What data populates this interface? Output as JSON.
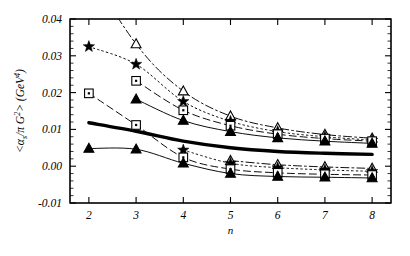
{
  "chart_data": {
    "type": "line",
    "title": "",
    "xlabel": "n",
    "ylabel": "<(αs/π) G2> (GeV4)",
    "ylabel_parts": {
      "bracket_open": "<",
      "numerator": "α",
      "numerator_sub": "s",
      "denominator": "π",
      "g": "G",
      "g_sup": "2",
      "bracket_close": ">",
      "units_open": "(",
      "units": "GeV",
      "units_sup": "4",
      "units_close": ")"
    },
    "x": [
      2,
      3,
      4,
      5,
      6,
      7,
      8
    ],
    "xlim": [
      1.6,
      8.4
    ],
    "ylim": [
      -0.01,
      0.04
    ],
    "xticks": [
      2,
      3,
      4,
      5,
      6,
      7,
      8
    ],
    "xticklabels": [
      "2",
      "3",
      "4",
      "5",
      "6",
      "7",
      "8"
    ],
    "yticks": [
      -0.01,
      0.0,
      0.01,
      0.02,
      0.03,
      0.04
    ],
    "yticklabels": [
      "-0.01",
      "0.00",
      "0.01",
      "0.02",
      "0.03",
      "0.04"
    ],
    "y_minor_tick_step": 0.002,
    "grid": false,
    "legend": "none",
    "frame": true,
    "tick_direction": "in",
    "series": [
      {
        "name": "upper-band-triangle",
        "marker": "open-triangle",
        "linestyle": "dashdot",
        "color": "#000000",
        "x": [
          3,
          4,
          5,
          6,
          7,
          8
        ],
        "values": [
          0.0332,
          0.0204,
          0.0136,
          0.0104,
          0.0086,
          0.0076
        ]
      },
      {
        "name": "upper-band-star",
        "marker": "filled-star",
        "linestyle": "dotted",
        "color": "#000000",
        "x": [
          2,
          3,
          4,
          5,
          6,
          7,
          8
        ],
        "values": [
          0.0325,
          0.0277,
          0.0176,
          0.0122,
          0.0094,
          0.008,
          0.0071
        ]
      },
      {
        "name": "upper-band-square",
        "marker": "open-square",
        "linestyle": "dashed",
        "color": "#000000",
        "x": [
          3,
          4,
          5,
          6,
          7,
          8
        ],
        "values": [
          0.0232,
          0.0152,
          0.011,
          0.0087,
          0.0075,
          0.0068
        ]
      },
      {
        "name": "upper-band-filled-triangle",
        "marker": "filled-triangle",
        "linestyle": "solid",
        "color": "#000000",
        "x": [
          3,
          4,
          5,
          6,
          7,
          8
        ],
        "values": [
          0.0182,
          0.0124,
          0.0094,
          0.0077,
          0.0068,
          0.0062
        ]
      },
      {
        "name": "central-thick-curve",
        "marker": "none",
        "linestyle": "solid-thick",
        "color": "#000000",
        "x": [
          2,
          3,
          4,
          5,
          6,
          7,
          8
        ],
        "values": [
          0.0118,
          0.0095,
          0.0068,
          0.005,
          0.004,
          0.0035,
          0.0032
        ]
      },
      {
        "name": "lower-band-open-triangle",
        "marker": "open-triangle",
        "linestyle": "dashdot",
        "color": "#000000",
        "x": [
          5,
          6,
          7,
          8
        ],
        "values": [
          0.0015,
          0.0004,
          -0.0002,
          -0.0006
        ]
      },
      {
        "name": "lower-band-star",
        "marker": "filled-star",
        "linestyle": "dotted",
        "color": "#000000",
        "x": [
          4,
          5,
          6,
          7,
          8
        ],
        "values": [
          0.0044,
          0.0008,
          -0.0004,
          -0.001,
          -0.0014
        ]
      },
      {
        "name": "lower-band-square",
        "marker": "open-square",
        "linestyle": "dashed",
        "color": "#000000",
        "x": [
          2,
          3,
          4,
          5,
          6,
          7,
          8
        ],
        "values": [
          0.0198,
          0.0112,
          0.0024,
          -0.0008,
          -0.0018,
          -0.0022,
          -0.0024
        ]
      },
      {
        "name": "lower-band-filled-triangle",
        "marker": "filled-triangle",
        "linestyle": "solid",
        "color": "#000000",
        "x": [
          2,
          3,
          4,
          5,
          6,
          7,
          8
        ],
        "values": [
          0.0048,
          0.0046,
          0.0008,
          -0.002,
          -0.0028,
          -0.003,
          -0.0032
        ]
      }
    ]
  }
}
